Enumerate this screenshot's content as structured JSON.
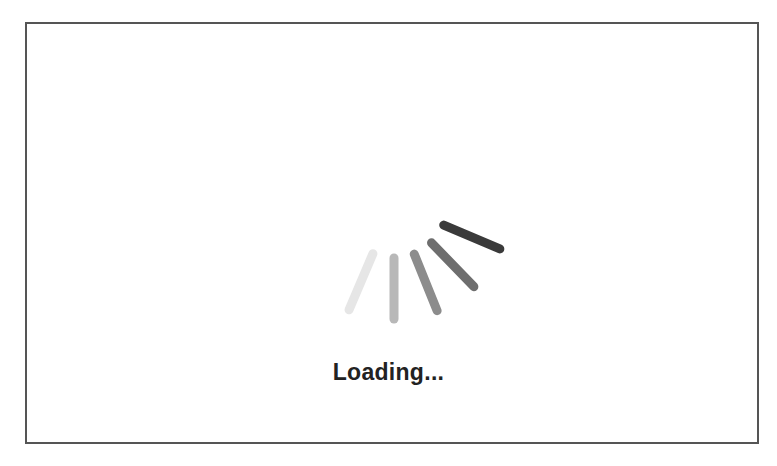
{
  "loading": {
    "text": "Loading...",
    "spinner": {
      "center": [
        394,
        204
      ],
      "inner_radius": 54,
      "outer_radius": 115,
      "thickness": 9,
      "spokes": [
        {
          "angle_deg": 23,
          "color": "#e6e6e6"
        },
        {
          "angle_deg": 0,
          "color": "#b8b8b8"
        },
        {
          "angle_deg": -22,
          "color": "#8c8c8c"
        },
        {
          "angle_deg": -44,
          "color": "#6e6e6e"
        },
        {
          "angle_deg": -67,
          "color": "#3a3a3a"
        }
      ]
    }
  },
  "colors": {
    "border": "#555555",
    "text": "#222222",
    "background": "#ffffff"
  }
}
